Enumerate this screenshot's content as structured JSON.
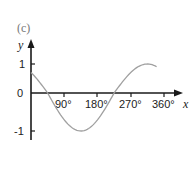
{
  "panel_label": "(c)",
  "chart_data": {
    "type": "line",
    "title": "(c)",
    "xlabel": "x",
    "ylabel": "y",
    "x_ticks": [
      "90°",
      "180°",
      "270°",
      "360°"
    ],
    "y_ticks": [
      "1",
      "0",
      "-1"
    ],
    "xlim": [
      0,
      360
    ],
    "ylim": [
      -1,
      1
    ],
    "grid": false,
    "legend": null,
    "series": [
      {
        "name": "y = cos(x + 45°)",
        "color": "#a0a0a0",
        "x": [
          0,
          45,
          90,
          135,
          180,
          225,
          270,
          315,
          340
        ],
        "values": [
          0.71,
          0,
          -0.71,
          -1,
          -0.71,
          0,
          0.71,
          1,
          0.91
        ]
      }
    ]
  },
  "colors": {
    "axis": "#1a1a1a",
    "curve": "#a0a0a0",
    "panel_label": "#777777"
  }
}
